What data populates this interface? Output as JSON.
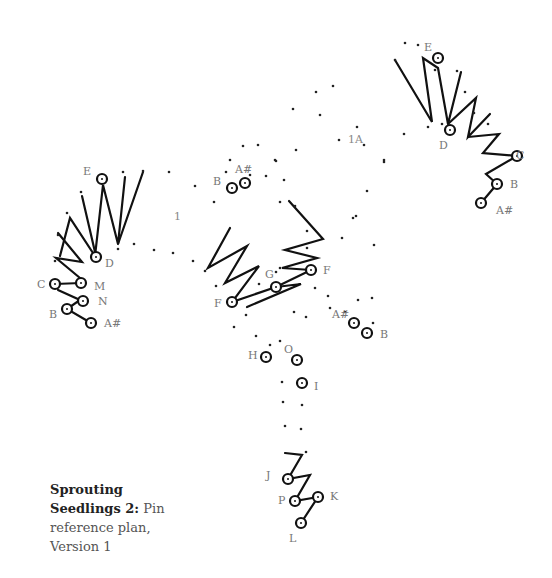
{
  "caption": {
    "title": "Sprouting Seedlings 2:",
    "text": " Pin reference plan, Version 1"
  },
  "section_labels": [
    {
      "text": "1",
      "x": 174,
      "y": 220
    },
    {
      "text": "1A",
      "x": 348,
      "y": 143
    }
  ],
  "pin_labels": [
    {
      "text": "E",
      "x": 83,
      "y": 175
    },
    {
      "text": "D",
      "x": 105,
      "y": 267
    },
    {
      "text": "C",
      "x": 37,
      "y": 288
    },
    {
      "text": "M",
      "x": 94,
      "y": 290
    },
    {
      "text": "N",
      "x": 98,
      "y": 305
    },
    {
      "text": "B",
      "x": 49,
      "y": 318
    },
    {
      "text": "A#",
      "x": 104,
      "y": 327
    },
    {
      "text": "B",
      "x": 213,
      "y": 185
    },
    {
      "text": "A#",
      "x": 235,
      "y": 173
    },
    {
      "text": "G",
      "x": 265,
      "y": 278
    },
    {
      "text": "F",
      "x": 323,
      "y": 274
    },
    {
      "text": "F",
      "x": 214,
      "y": 307
    },
    {
      "text": "A#",
      "x": 332,
      "y": 318
    },
    {
      "text": "B",
      "x": 380,
      "y": 338
    },
    {
      "text": "H",
      "x": 248,
      "y": 359
    },
    {
      "text": "O",
      "x": 284,
      "y": 353
    },
    {
      "text": "I",
      "x": 314,
      "y": 390
    },
    {
      "text": "J",
      "x": 266,
      "y": 479
    },
    {
      "text": "P",
      "x": 278,
      "y": 504
    },
    {
      "text": "K",
      "x": 330,
      "y": 500
    },
    {
      "text": "L",
      "x": 289,
      "y": 542
    },
    {
      "text": "E",
      "x": 424,
      "y": 51
    },
    {
      "text": "D",
      "x": 439,
      "y": 149
    },
    {
      "text": "C",
      "x": 516,
      "y": 159
    },
    {
      "text": "B",
      "x": 510,
      "y": 188
    },
    {
      "text": "A#",
      "x": 496,
      "y": 214
    }
  ],
  "pins": [
    [
      102,
      179
    ],
    [
      96,
      257
    ],
    [
      55,
      284
    ],
    [
      81,
      283
    ],
    [
      83,
      301
    ],
    [
      67,
      309
    ],
    [
      91,
      323
    ],
    [
      232,
      188
    ],
    [
      245,
      183
    ],
    [
      276,
      287
    ],
    [
      311,
      270
    ],
    [
      232,
      302
    ],
    [
      354,
      323
    ],
    [
      367,
      333
    ],
    [
      266,
      357
    ],
    [
      297,
      360
    ],
    [
      302,
      383
    ],
    [
      288,
      479
    ],
    [
      295,
      501
    ],
    [
      318,
      497
    ],
    [
      301,
      523
    ],
    [
      438,
      58
    ],
    [
      450,
      130
    ],
    [
      517,
      156
    ],
    [
      497,
      184
    ],
    [
      481,
      203
    ]
  ],
  "strokes": [
    [
      [
        60,
        256
      ],
      [
        70,
        218
      ],
      [
        95,
        256
      ],
      [
        103,
        185
      ],
      [
        118,
        244
      ],
      [
        125,
        177
      ]
    ],
    [
      [
        82,
        196
      ],
      [
        95,
        252
      ]
    ],
    [
      [
        118,
        244
      ],
      [
        143,
        172
      ]
    ],
    [
      [
        58,
        233
      ],
      [
        82,
        262
      ],
      [
        56,
        258
      ],
      [
        80,
        278
      ]
    ],
    [
      [
        55,
        284
      ],
      [
        81,
        283
      ]
    ],
    [
      [
        58,
        290
      ],
      [
        80,
        300
      ],
      [
        67,
        309
      ],
      [
        91,
        323
      ]
    ],
    [
      [
        230,
        228
      ],
      [
        208,
        268
      ],
      [
        247,
        246
      ],
      [
        225,
        283
      ],
      [
        259,
        266
      ],
      [
        232,
        302
      ],
      [
        276,
        287
      ],
      [
        311,
        270
      ]
    ],
    [
      [
        247,
        307
      ],
      [
        301,
        284
      ],
      [
        276,
        287
      ]
    ],
    [
      [
        289,
        201
      ],
      [
        323,
        239
      ],
      [
        285,
        250
      ],
      [
        317,
        258
      ],
      [
        282,
        268
      ],
      [
        311,
        270
      ]
    ],
    [
      [
        395,
        60
      ],
      [
        432,
        122
      ],
      [
        423,
        58
      ],
      [
        438,
        68
      ],
      [
        448,
        124
      ],
      [
        461,
        72
      ]
    ],
    [
      [
        448,
        124
      ],
      [
        476,
        98
      ],
      [
        468,
        137
      ],
      [
        490,
        114
      ]
    ],
    [
      [
        468,
        137
      ],
      [
        499,
        134
      ],
      [
        483,
        153
      ],
      [
        517,
        156
      ],
      [
        486,
        174
      ],
      [
        497,
        184
      ],
      [
        481,
        203
      ]
    ],
    [
      [
        285,
        453
      ],
      [
        302,
        455
      ],
      [
        288,
        479
      ],
      [
        310,
        475
      ],
      [
        295,
        501
      ],
      [
        318,
        497
      ],
      [
        301,
        523
      ]
    ]
  ],
  "dots": [
    [
      81,
      192
    ],
    [
      67,
      213
    ],
    [
      58,
      235
    ],
    [
      55,
      261
    ],
    [
      123,
      172
    ],
    [
      143,
      171
    ],
    [
      118,
      249
    ],
    [
      134,
      244
    ],
    [
      154,
      250
    ],
    [
      173,
      253
    ],
    [
      193,
      261
    ],
    [
      169,
      172
    ],
    [
      195,
      186
    ],
    [
      214,
      202
    ],
    [
      230,
      160
    ],
    [
      243,
      146
    ],
    [
      258,
      145
    ],
    [
      250,
      175
    ],
    [
      226,
      172
    ],
    [
      266,
      176
    ],
    [
      275,
      160
    ],
    [
      293,
      109
    ],
    [
      316,
      92
    ],
    [
      333,
      86
    ],
    [
      276,
      161
    ],
    [
      280,
      202
    ],
    [
      296,
      150
    ],
    [
      284,
      180
    ],
    [
      320,
      115
    ],
    [
      339,
      140
    ],
    [
      357,
      127
    ],
    [
      384,
      162
    ],
    [
      367,
      191
    ],
    [
      353,
      218
    ],
    [
      374,
      245
    ],
    [
      356,
      216
    ],
    [
      342,
      238
    ],
    [
      395,
      60
    ],
    [
      405,
      43
    ],
    [
      418,
      45
    ],
    [
      435,
      70
    ],
    [
      457,
      71
    ],
    [
      465,
      92
    ],
    [
      474,
      113
    ],
    [
      488,
      124
    ],
    [
      442,
      124
    ],
    [
      428,
      127
    ],
    [
      404,
      134
    ],
    [
      364,
      145
    ],
    [
      384,
      160
    ],
    [
      280,
      268
    ],
    [
      295,
      206
    ],
    [
      259,
      284
    ],
    [
      276,
      272
    ],
    [
      307,
      248
    ],
    [
      307,
      231
    ],
    [
      205,
      271
    ],
    [
      216,
      286
    ],
    [
      246,
      315
    ],
    [
      234,
      327
    ],
    [
      294,
      312
    ],
    [
      306,
      317
    ],
    [
      315,
      288
    ],
    [
      328,
      296
    ],
    [
      330,
      308
    ],
    [
      345,
      312
    ],
    [
      358,
      300
    ],
    [
      372,
      298
    ],
    [
      373,
      323
    ],
    [
      256,
      336
    ],
    [
      270,
      345
    ],
    [
      280,
      341
    ],
    [
      282,
      382
    ],
    [
      283,
      402
    ],
    [
      302,
      405
    ],
    [
      285,
      426
    ],
    [
      301,
      429
    ],
    [
      306,
      452
    ]
  ]
}
